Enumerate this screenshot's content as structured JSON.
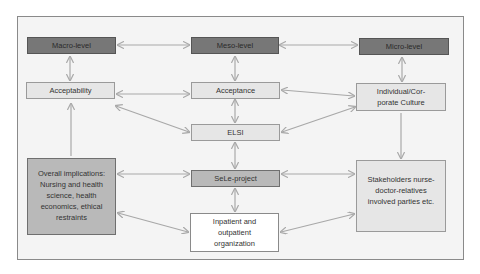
{
  "diagram": {
    "nodes": {
      "macro": "Macro-level",
      "meso": "Meso-level",
      "micro": "Micro-level",
      "acceptability": "Acceptability",
      "acceptance": "Acceptance",
      "culture": "Individual/Cor-porate Culture",
      "elsi": "ELSI",
      "sele": "SeLe-project",
      "overall": "Overall implications: Nursing and health science, health economics, ethical restraints",
      "stakeholders": "Stakeholders nurse-doctor-relatives involved parties etc.",
      "inpatient": "Inpatient and outpatient organization"
    },
    "edges": [
      [
        "macro",
        "meso"
      ],
      [
        "meso",
        "micro"
      ],
      [
        "macro",
        "acceptability"
      ],
      [
        "meso",
        "acceptance"
      ],
      [
        "micro",
        "culture"
      ],
      [
        "acceptability",
        "acceptance"
      ],
      [
        "acceptance",
        "culture"
      ],
      [
        "acceptability",
        "elsi"
      ],
      [
        "culture",
        "elsi"
      ],
      [
        "acceptance",
        "elsi"
      ],
      [
        "elsi",
        "sele"
      ],
      [
        "sele",
        "inpatient"
      ],
      [
        "acceptability",
        "overall"
      ],
      [
        "culture",
        "stakeholders"
      ],
      [
        "overall",
        "sele"
      ],
      [
        "sele",
        "stakeholders"
      ],
      [
        "overall",
        "inpatient"
      ],
      [
        "inpatient",
        "stakeholders"
      ]
    ],
    "colors": {
      "arrow": "#a8a8a8",
      "dark_box": "#777777",
      "mid_box": "#b9b9b9",
      "light_box": "#e6e6e6"
    }
  }
}
